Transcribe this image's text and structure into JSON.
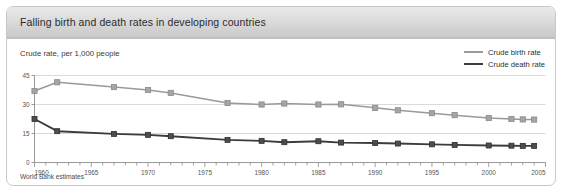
{
  "panel": {
    "title": "Falling birth and death rates in developing countries",
    "subtitle": "Crude rate, per 1,000 people",
    "footnote": "World Bank estimates"
  },
  "legend": {
    "position": "top-right",
    "entries": [
      {
        "label": "Crude birth rate",
        "color": "#9a9a9a"
      },
      {
        "label": "Crude death rate",
        "color": "#3c3c3c"
      }
    ]
  },
  "chart_data": {
    "type": "line",
    "title": "Falling birth and death rates in developing countries",
    "subtitle": "Crude rate, per 1,000 people",
    "xlabel": "",
    "ylabel": "Crude rate, per 1,000 people",
    "xlim": [
      1960,
      2005
    ],
    "ylim": [
      0,
      45
    ],
    "y_ticks": [
      0,
      15,
      30,
      45
    ],
    "x_ticks": [
      1960,
      1965,
      1970,
      1975,
      1980,
      1985,
      1990,
      1995,
      2000,
      2005
    ],
    "x_minor_tick_step": 1,
    "grid": "horizontal",
    "marker": "square",
    "x": [
      1960,
      1962,
      1967,
      1970,
      1972,
      1977,
      1980,
      1982,
      1985,
      1987,
      1990,
      1992,
      1995,
      1997,
      2000,
      2002,
      2003,
      2004
    ],
    "series": [
      {
        "name": "Crude birth rate",
        "color": "#9a9a9a",
        "values": [
          37.0,
          41.5,
          39.0,
          37.5,
          36.0,
          30.8,
          30.0,
          30.5,
          30.0,
          30.1,
          28.3,
          27.0,
          25.5,
          24.5,
          23.0,
          22.5,
          22.3,
          22.2
        ]
      },
      {
        "name": "Crude death rate",
        "color": "#3c3c3c",
        "values": [
          22.5,
          16.2,
          14.8,
          14.3,
          13.6,
          11.7,
          11.2,
          10.5,
          11.0,
          10.3,
          10.1,
          9.8,
          9.4,
          9.1,
          8.8,
          8.7,
          8.6,
          8.6
        ]
      }
    ],
    "footnote": "World Bank estimates"
  }
}
